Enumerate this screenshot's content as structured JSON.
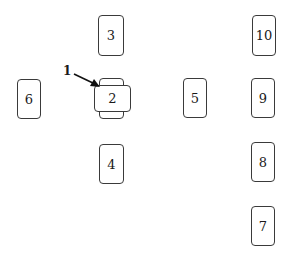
{
  "diagram": {
    "callout": {
      "label": "1",
      "target": "2"
    },
    "boxes": [
      {
        "id": "3",
        "label": "3"
      },
      {
        "id": "2",
        "label": "2"
      },
      {
        "id": "4",
        "label": "4"
      },
      {
        "id": "6",
        "label": "6"
      },
      {
        "id": "5",
        "label": "5"
      },
      {
        "id": "10",
        "label": "10"
      },
      {
        "id": "9",
        "label": "9"
      },
      {
        "id": "8",
        "label": "8"
      },
      {
        "id": "7",
        "label": "7"
      }
    ],
    "colors": {
      "stroke": "#3a3a3a",
      "text": "#1a1a1a",
      "background": "#ffffff"
    }
  }
}
